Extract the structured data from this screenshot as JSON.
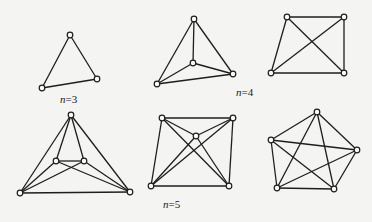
{
  "figure": {
    "background": "#f4f4f2",
    "stroke_color": "#1e1e1e",
    "graphs": [
      {
        "id": "g1",
        "label": "n=3",
        "label_n": "n",
        "label_rest": "=3",
        "label_pos": [
          60,
          103
        ],
        "vertices": [
          [
            70,
            35
          ],
          [
            97,
            79
          ],
          [
            42,
            88
          ]
        ],
        "edges": [
          [
            0,
            1
          ],
          [
            1,
            2
          ],
          [
            2,
            0
          ]
        ]
      },
      {
        "id": "g2",
        "label": "n=4",
        "label_n": "n",
        "label_rest": "=4",
        "label_pos": [
          236,
          96
        ],
        "vertices": [
          [
            194,
            19
          ],
          [
            193,
            63
          ],
          [
            233,
            74
          ],
          [
            157,
            84
          ]
        ],
        "edges": [
          [
            0,
            1
          ],
          [
            0,
            2
          ],
          [
            0,
            3
          ],
          [
            1,
            2
          ],
          [
            1,
            3
          ],
          [
            2,
            3
          ]
        ]
      },
      {
        "id": "g3",
        "label": "",
        "vertices": [
          [
            287,
            17
          ],
          [
            344,
            17
          ],
          [
            271,
            73
          ],
          [
            344,
            73
          ]
        ],
        "edges": [
          [
            0,
            1
          ],
          [
            0,
            2
          ],
          [
            1,
            3
          ],
          [
            2,
            3
          ],
          [
            0,
            3
          ],
          [
            1,
            2
          ]
        ]
      },
      {
        "id": "g4",
        "label": "",
        "vertices": [
          [
            71,
            115
          ],
          [
            56,
            161
          ],
          [
            84,
            161
          ],
          [
            20,
            193
          ],
          [
            130,
            192
          ]
        ],
        "edges": [
          [
            0,
            3
          ],
          [
            0,
            4
          ],
          [
            0,
            1
          ],
          [
            0,
            2
          ],
          [
            1,
            2
          ],
          [
            3,
            4
          ],
          [
            3,
            2
          ],
          [
            4,
            1
          ],
          [
            3,
            1
          ],
          [
            4,
            2
          ]
        ]
      },
      {
        "id": "g5",
        "label": "n=5",
        "label_n": "n",
        "label_rest": "=5",
        "label_pos": [
          163,
          208
        ],
        "vertices": [
          [
            162,
            118
          ],
          [
            233,
            118
          ],
          [
            196,
            136
          ],
          [
            151,
            186
          ],
          [
            229,
            186
          ]
        ],
        "edges": [
          [
            0,
            1
          ],
          [
            0,
            3
          ],
          [
            1,
            4
          ],
          [
            3,
            4
          ],
          [
            0,
            4
          ],
          [
            1,
            3
          ],
          [
            2,
            0
          ],
          [
            2,
            1
          ],
          [
            2,
            3
          ],
          [
            2,
            4
          ]
        ]
      },
      {
        "id": "g6",
        "label": "",
        "vertices": [
          [
            317,
            112
          ],
          [
            271,
            140
          ],
          [
            357,
            150
          ],
          [
            277,
            188
          ],
          [
            334,
            189
          ]
        ],
        "edges": [
          [
            0,
            1
          ],
          [
            0,
            2
          ],
          [
            1,
            3
          ],
          [
            2,
            4
          ],
          [
            3,
            4
          ],
          [
            0,
            3
          ],
          [
            0,
            4
          ],
          [
            1,
            2
          ],
          [
            1,
            4
          ],
          [
            2,
            3
          ]
        ]
      }
    ]
  }
}
